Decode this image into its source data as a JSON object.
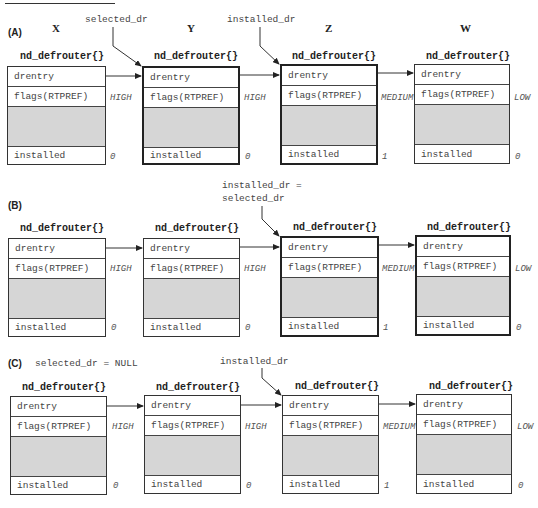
{
  "columns": [
    "X",
    "Y",
    "Z",
    "W"
  ],
  "struct_name": "nd_defrouter{}",
  "fields": {
    "drentry": "drentry",
    "flags": "flags(RTPREF)",
    "installed": "installed"
  },
  "panels": [
    {
      "label": "(A)",
      "pointer_labels": [
        {
          "text": "selected_dr",
          "target": "Y"
        },
        {
          "text": "installed_dr",
          "target": "Z"
        }
      ],
      "boxes": [
        {
          "col": "X",
          "preference": "HIGH",
          "installed": "0",
          "highlighted": false
        },
        {
          "col": "Y",
          "preference": "HIGH",
          "installed": "0",
          "highlighted": true
        },
        {
          "col": "Z",
          "preference": "MEDIUM",
          "installed": "1",
          "highlighted": true
        },
        {
          "col": "W",
          "preference": "LOW",
          "installed": "0",
          "highlighted": false
        }
      ]
    },
    {
      "label": "(B)",
      "pointer_labels": [
        {
          "text_line1": "installed_dr =",
          "text_line2": "selected_dr",
          "target": "Z"
        }
      ],
      "boxes": [
        {
          "col": "X",
          "preference": "HIGH",
          "installed": "0",
          "highlighted": false
        },
        {
          "col": "Y",
          "preference": "HIGH",
          "installed": "0",
          "highlighted": false
        },
        {
          "col": "Z",
          "preference": "MEDIUM",
          "installed": "1",
          "highlighted": true
        },
        {
          "col": "W",
          "preference": "LOW",
          "installed": "0",
          "highlighted": true
        }
      ]
    },
    {
      "label": "(C)",
      "note": "selected_dr = NULL",
      "pointer_labels": [
        {
          "text": "installed_dr",
          "target": "Z"
        }
      ],
      "boxes": [
        {
          "col": "X",
          "preference": "HIGH",
          "installed": "0",
          "highlighted": false
        },
        {
          "col": "Y",
          "preference": "HIGH",
          "installed": "0",
          "highlighted": false
        },
        {
          "col": "Z",
          "preference": "MEDIUM",
          "installed": "1",
          "highlighted": false
        },
        {
          "col": "W",
          "preference": "LOW",
          "installed": "0",
          "highlighted": false
        }
      ]
    }
  ]
}
